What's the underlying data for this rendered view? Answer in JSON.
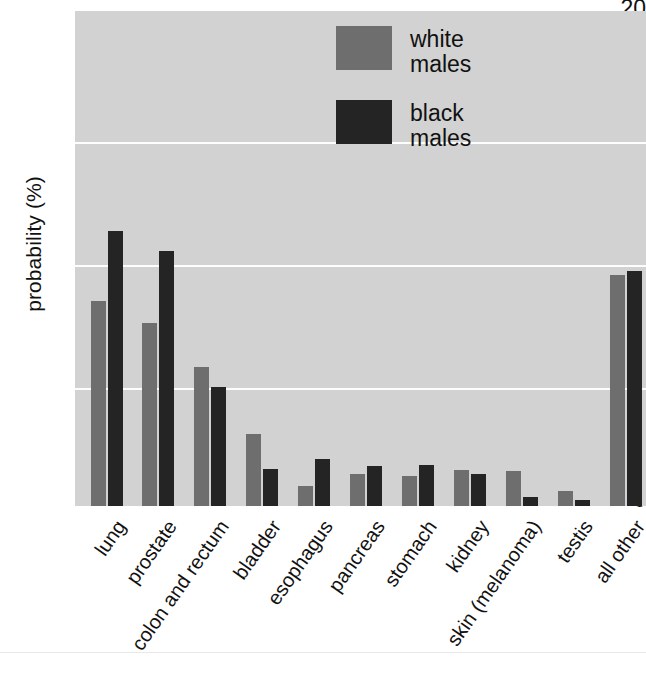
{
  "chart_data": {
    "type": "bar",
    "title": "",
    "xlabel": "",
    "ylabel": "probability (%)",
    "ylim": [
      0,
      20
    ],
    "yticks": [
      0,
      5,
      10,
      15,
      20
    ],
    "ytick_labels": [
      "0",
      "5",
      "10",
      "15",
      "20"
    ],
    "grid": true,
    "grid_orientation": "horizontal",
    "legend_position": "top-right",
    "categories": [
      "lung",
      "prostate",
      "colon and rectum",
      "bladder",
      "esophagus",
      "pancreas",
      "stomach",
      "kidney",
      "skin (melanoma)",
      "testis",
      "all other"
    ],
    "series": [
      {
        "name": "white males",
        "color": "#6e6e6e",
        "values": [
          8.3,
          7.4,
          5.6,
          2.9,
          0.8,
          1.3,
          1.2,
          1.45,
          1.4,
          0.6,
          9.35
        ]
      },
      {
        "name": "black males",
        "color": "#242424",
        "values": [
          11.1,
          10.3,
          4.8,
          1.5,
          1.9,
          1.6,
          1.65,
          1.3,
          0.35,
          0.25,
          9.5
        ]
      }
    ]
  },
  "legend": {
    "items": [
      {
        "label": "white\nmales",
        "series": "white males"
      },
      {
        "label": "black\nmales",
        "series": "black males"
      }
    ]
  },
  "colors": {
    "plot_background": "#d2d2d2",
    "gridline": "#fdfdfd",
    "page_background": "#ffffff",
    "white_males_bar": "#6e6e6e",
    "black_males_bar": "#242424",
    "text": "#111111"
  }
}
